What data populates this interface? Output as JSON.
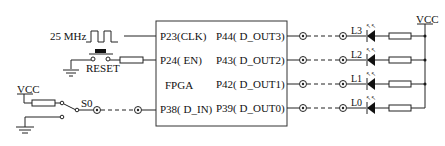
{
  "diagram": {
    "clock": {
      "label": "25 MHz"
    },
    "reset": {
      "label": "RESET"
    },
    "switch": {
      "vcc_label": "VCC",
      "label": "S0"
    },
    "fpga": {
      "name": "FPGA",
      "left_pins": [
        {
          "label": "P23(CLK)"
        },
        {
          "label": "P24( EN)"
        },
        {
          "label": "P38( D_IN)"
        }
      ],
      "right_pins": [
        {
          "label": "P44( D_OUT3)"
        },
        {
          "label": "P43( D_OUT2)"
        },
        {
          "label": "P42( D_OUT1)"
        },
        {
          "label": "P39( D_OUT0)"
        }
      ]
    },
    "leds": [
      {
        "label": "L3"
      },
      {
        "label": "L2"
      },
      {
        "label": "L1"
      },
      {
        "label": "L0"
      }
    ],
    "vcc_right": {
      "label": "VCC"
    }
  }
}
